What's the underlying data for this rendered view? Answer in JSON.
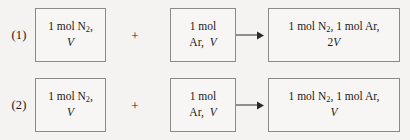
{
  "diagram": {
    "type": "gas-mixing-equations",
    "rows": [
      {
        "label": "(1)",
        "reactant_a": {
          "line1": "1 mol N",
          "line1_sub": "2",
          "line1_tail": ",",
          "line2": "V"
        },
        "operator": "+",
        "reactant_b": {
          "line1": "1 mol",
          "line2_prefix": "Ar,",
          "line2_var": "V"
        },
        "arrow": "right-arrow",
        "product": {
          "line1_a": "1 mol N",
          "line1_sub": "2",
          "line1_mid": ",  1 mol Ar,",
          "line2_coeff": "2",
          "line2_var": "V"
        }
      },
      {
        "label": "(2)",
        "reactant_a": {
          "line1": "1 mol N",
          "line1_sub": "2",
          "line1_tail": ",",
          "line2": "V"
        },
        "operator": "+",
        "reactant_b": {
          "line1": "1 mol",
          "line2_prefix": "Ar,",
          "line2_var": "V"
        },
        "arrow": "right-arrow",
        "product": {
          "line1_a": "1 mol N",
          "line1_sub": "2",
          "line1_mid": ",  1 mol Ar,",
          "line2_coeff": "",
          "line2_var": "V"
        }
      }
    ],
    "colors": {
      "background": "#f4f3f1",
      "box_border": "#8a8a8a",
      "box_fill": "#f7f6f4",
      "text": "#1a1a1a",
      "arrow": "#2a2a2a"
    }
  }
}
